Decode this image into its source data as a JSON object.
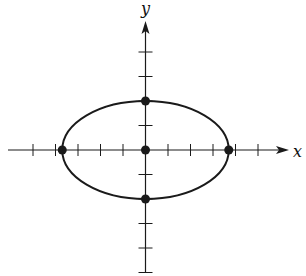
{
  "figure": {
    "axes": {
      "x_label": "x",
      "y_label": "y",
      "x_ticks": [
        -5,
        -4,
        -3,
        -2,
        -1,
        1,
        2,
        3,
        4,
        5
      ],
      "y_ticks": [
        -5,
        -4,
        -3,
        -2,
        -1,
        1,
        2,
        3,
        4
      ],
      "x_range": [
        -6.3,
        6.4
      ],
      "y_range": [
        -5,
        5.2
      ]
    },
    "ellipse": {
      "center": [
        0,
        0
      ],
      "semi_major_x": 3.7,
      "semi_minor_y": 2
    },
    "points": [
      {
        "label": "left-vertex",
        "x": -3.7,
        "y": 0
      },
      {
        "label": "right-vertex",
        "x": 3.7,
        "y": 0
      },
      {
        "label": "top-covertex",
        "x": 0,
        "y": 2
      },
      {
        "label": "bottom-covertex",
        "x": 0,
        "y": -2
      },
      {
        "label": "center",
        "x": 0,
        "y": 0
      }
    ],
    "colors": {
      "stroke": "#1a1a1a",
      "background": "#ffffff"
    }
  }
}
